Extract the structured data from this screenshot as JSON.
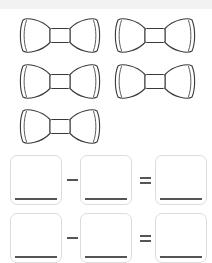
{
  "worksheet": {
    "title": "Subtraction picture worksheet",
    "background_color": "#ffffff",
    "top_band_color": "#f2f2f2",
    "ink_color": "#3a3a3a",
    "box_border_color": "#dcdcdc",
    "write_line_color": "#555555"
  },
  "objects": {
    "icon_name": "bow-tie-icon",
    "label": "bow tie",
    "count": 5,
    "rows": [
      {
        "row_label": "row-1",
        "count": 2
      },
      {
        "row_label": "row-2",
        "count": 2
      },
      {
        "row_label": "row-3",
        "count": 1
      }
    ],
    "items": [
      {
        "id": "bowtie-1",
        "x": 17,
        "y": 13
      },
      {
        "id": "bowtie-2",
        "x": 112,
        "y": 13
      },
      {
        "id": "bowtie-3",
        "x": 17,
        "y": 59
      },
      {
        "id": "bowtie-4",
        "x": 112,
        "y": 59
      },
      {
        "id": "bowtie-5",
        "x": 17,
        "y": 104
      }
    ]
  },
  "equations": [
    {
      "id": "equation-row-1",
      "y": 155,
      "minuend": "",
      "minuend_placeholder": "",
      "operator": "minus-sign",
      "operator_symbol": "−",
      "subtrahend": "",
      "subtrahend_placeholder": "",
      "relation": "equals-sign",
      "relation_symbol": "=",
      "result": "",
      "result_placeholder": ""
    },
    {
      "id": "equation-row-2",
      "y": 213,
      "minuend": "",
      "minuend_placeholder": "",
      "operator": "minus-sign",
      "operator_symbol": "−",
      "subtrahend": "",
      "subtrahend_placeholder": "",
      "relation": "equals-sign",
      "relation_symbol": "=",
      "result": "",
      "result_placeholder": ""
    }
  ],
  "layout": {
    "box_positions_x": [
      10,
      80,
      155
    ],
    "minus_x": 66,
    "equals_x": 139
  }
}
